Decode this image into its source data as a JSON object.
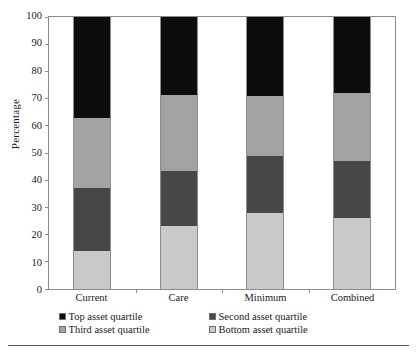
{
  "chart_data": {
    "type": "bar",
    "stacked": true,
    "title": "",
    "subtitle": "",
    "xlabel": "",
    "ylabel": "Percentage",
    "ylim": [
      0,
      100
    ],
    "yticks": [
      0,
      10,
      20,
      30,
      40,
      50,
      60,
      70,
      80,
      90,
      100
    ],
    "ytick_labels": [
      "0",
      "10",
      "20",
      "30",
      "40",
      "50",
      "60",
      "70",
      "80",
      "90",
      "100"
    ],
    "grid": false,
    "frame": true,
    "legend_position": "bottom",
    "categories": [
      "Current",
      "Care",
      "Minimum",
      "Combined"
    ],
    "series": [
      {
        "name": "Bottom asset quartile",
        "color": "#c9c9c9",
        "values": [
          14,
          23,
          28,
          26
        ]
      },
      {
        "name": "Second asset quartile",
        "color": "#474747",
        "values": [
          23,
          20.5,
          21,
          21
        ]
      },
      {
        "name": "Third asset quartile",
        "color": "#a3a3a3",
        "values": [
          26,
          28,
          22,
          25
        ]
      },
      {
        "name": "Top asset quartile",
        "color": "#0d0d0d",
        "values": [
          37,
          28.5,
          29,
          28
        ]
      }
    ],
    "cumulative_tops": {
      "Current": [
        14,
        37,
        63,
        100
      ],
      "Care": [
        23,
        43.5,
        71.5,
        100
      ],
      "Minimum": [
        28,
        49,
        71,
        100
      ],
      "Combined": [
        26,
        47,
        72,
        100
      ]
    },
    "annotations": []
  },
  "legend": {
    "rows": [
      [
        {
          "label": "Top asset quartile",
          "color": "#0d0d0d",
          "icon": "legend-swatch-icon"
        },
        {
          "label": "Second asset quartile",
          "color": "#474747",
          "icon": "legend-swatch-icon"
        }
      ],
      [
        {
          "label": "Third asset quartile",
          "color": "#a3a3a3",
          "icon": "legend-swatch-icon"
        },
        {
          "label": "Bottom asset quartile",
          "color": "#c9c9c9",
          "icon": "legend-swatch-icon"
        }
      ]
    ]
  },
  "colors": {
    "top_asset_quartile": "#0d0d0d",
    "second_asset_quartile": "#474747",
    "third_asset_quartile": "#a3a3a3",
    "bottom_asset_quartile": "#c9c9c9",
    "axis": "#8c8c8c",
    "text": "#1a1a1a",
    "background": "#ffffff",
    "footer_rule": "#5a5a5a"
  }
}
